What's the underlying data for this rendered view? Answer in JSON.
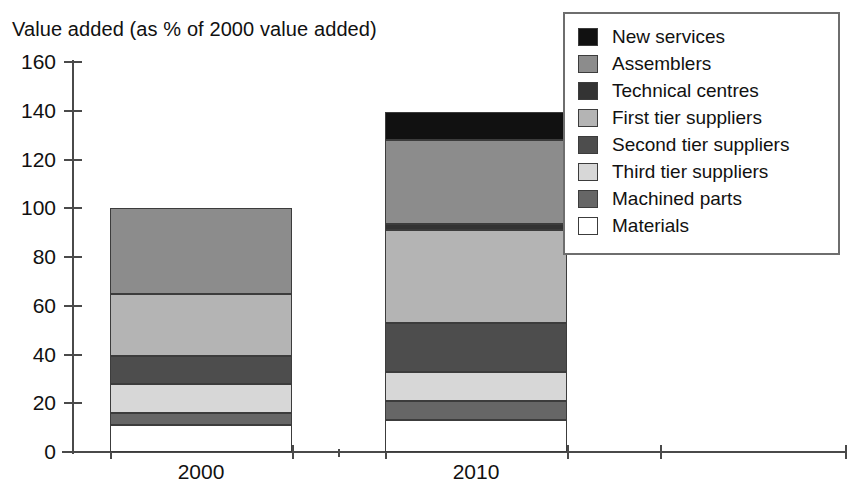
{
  "chart_data": {
    "type": "bar",
    "subtype": "stacked-bar",
    "title": "Value added (as % of 2000 value added)",
    "ylabel": "Value added (as % of 2000 value added)",
    "xlabel": "",
    "categories": [
      "2000",
      "2010"
    ],
    "ylim": [
      0,
      160
    ],
    "yticks": [
      0,
      20,
      40,
      60,
      80,
      100,
      120,
      140,
      160
    ],
    "ytick_labels": [
      "0",
      "20",
      "40",
      "60",
      "80",
      "100",
      "120",
      "140",
      "160"
    ],
    "grid": false,
    "legend_position": "top-right",
    "stack_order_bottom_to_top": [
      "Materials",
      "Machined parts",
      "Third tier suppliers",
      "Second tier suppliers",
      "First tier suppliers",
      "Technical centres",
      "Assemblers",
      "New services"
    ],
    "series": [
      {
        "name": "New services",
        "color": "#111111",
        "values": [
          0.0,
          11.5
        ]
      },
      {
        "name": "Assemblers",
        "color": "#8c8c8c",
        "values": [
          35.0,
          34.5
        ]
      },
      {
        "name": "Technical centres",
        "color": "#333333",
        "values": [
          0.0,
          2.5
        ]
      },
      {
        "name": "First tier suppliers",
        "color": "#b4b4b4",
        "values": [
          25.5,
          38.0
        ]
      },
      {
        "name": "Second tier suppliers",
        "color": "#4d4d4d",
        "values": [
          11.5,
          20.0
        ]
      },
      {
        "name": "Third tier suppliers",
        "color": "#d7d7d7",
        "values": [
          12.0,
          12.0
        ]
      },
      {
        "name": "Machined parts",
        "color": "#666666",
        "values": [
          5.0,
          8.0
        ]
      },
      {
        "name": "Materials",
        "color": "#ffffff",
        "values": [
          11.0,
          13.0
        ]
      }
    ],
    "totals": [
      100.0,
      139.5
    ],
    "bar_breakpoints": {
      "2000": [
        0,
        11,
        16,
        28,
        39.5,
        65,
        65,
        100,
        100
      ],
      "2010": [
        0,
        13,
        21,
        33,
        53,
        91,
        93.5,
        128,
        139.5
      ]
    }
  },
  "legend": {
    "items": [
      {
        "label": "New services",
        "color": "#111111"
      },
      {
        "label": "Assemblers",
        "color": "#8c8c8c"
      },
      {
        "label": "Technical centres",
        "color": "#333333"
      },
      {
        "label": "First tier suppliers",
        "color": "#b4b4b4"
      },
      {
        "label": "Second tier suppliers",
        "color": "#4d4d4d"
      },
      {
        "label": "Third tier suppliers",
        "color": "#d7d7d7"
      },
      {
        "label": "Machined parts",
        "color": "#666666"
      },
      {
        "label": "Materials",
        "color": "#ffffff"
      }
    ]
  },
  "axes": {
    "y_tick_labels": [
      "160",
      "140",
      "120",
      "100",
      "80",
      "60",
      "40",
      "20",
      "0"
    ],
    "x_tick_labels": [
      "2000",
      "2010"
    ]
  },
  "colors": {
    "axis": "#4a4a4a",
    "segment_border": "#3c3c3c",
    "legend_border": "#6e6e6e",
    "text": "#111111",
    "background": "#ffffff"
  }
}
